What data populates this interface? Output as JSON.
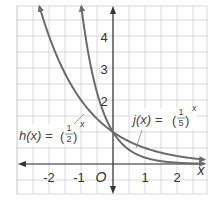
{
  "chart_data": {
    "type": "line",
    "title": "",
    "xlabel": "x",
    "ylabel": "",
    "origin_label": "O",
    "xlim": [
      -2.9,
      3.0
    ],
    "ylim": [
      -0.9,
      4.9
    ],
    "grid": true,
    "grid_step": 0.5,
    "x_ticks": [
      "-2",
      "-1",
      "1",
      "2"
    ],
    "y_ticks": [
      "2",
      "3",
      "4"
    ],
    "series": [
      {
        "name": "h(x) = (1/2)^x",
        "label_prefix": "h(x) =",
        "base_num": "1",
        "base_den": "2",
        "exponent": "x",
        "points": [
          [
            -2.3,
            4.92
          ],
          [
            -2,
            4
          ],
          [
            -1,
            2
          ],
          [
            0,
            1
          ],
          [
            1,
            0.5
          ],
          [
            2,
            0.25
          ],
          [
            2.9,
            0.13
          ]
        ]
      },
      {
        "name": "j(x) = (1/5)^x",
        "label_prefix": "j(x) =",
        "base_num": "1",
        "base_den": "5",
        "exponent": "x",
        "points": [
          [
            -0.99,
            4.92
          ],
          [
            -1,
            5
          ],
          [
            -0.5,
            2.24
          ],
          [
            0,
            1
          ],
          [
            1,
            0.2
          ],
          [
            2,
            0.04
          ],
          [
            2.9,
            0.01
          ]
        ]
      }
    ],
    "colors": {
      "curve": "#6b6b6b",
      "grid": "#d8d8d8",
      "axis": "#333333"
    }
  }
}
